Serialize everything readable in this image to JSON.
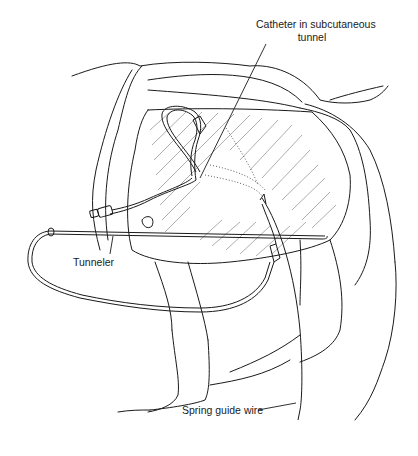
{
  "figure": {
    "type": "medical-illustration",
    "labels": {
      "catheter": [
        "Catheter in subcutaneous",
        "tunnel"
      ],
      "tunneler": "Tunneler",
      "spring_guide_wire": "Spring guide wire"
    },
    "colors": {
      "line": "#1a1a1a",
      "hatch": "#777777",
      "background": "#ffffff"
    }
  }
}
